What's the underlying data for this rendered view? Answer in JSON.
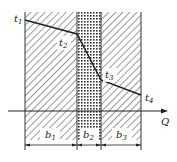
{
  "diagram": {
    "layers": [
      {
        "id": "b1",
        "label": "b",
        "sub": "1",
        "pattern": "diagonal-hatch"
      },
      {
        "id": "b2",
        "label": "b",
        "sub": "2",
        "pattern": "cross-hatch"
      },
      {
        "id": "b3",
        "label": "b",
        "sub": "3",
        "pattern": "diagonal-hatch"
      }
    ],
    "temperatures": [
      {
        "label": "t",
        "sub": "1"
      },
      {
        "label": "t",
        "sub": "2"
      },
      {
        "label": "t",
        "sub": "3"
      },
      {
        "label": "t",
        "sub": "4"
      }
    ],
    "axis": {
      "label": "Q"
    }
  }
}
